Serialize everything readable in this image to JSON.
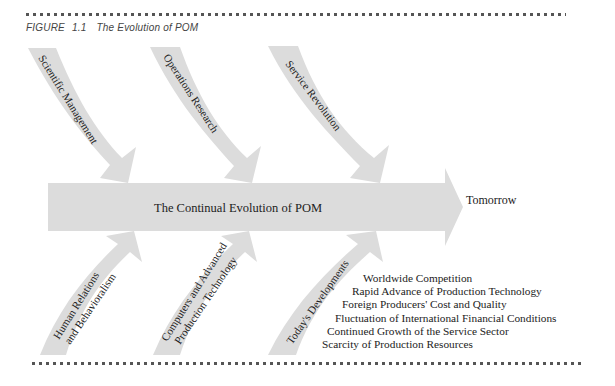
{
  "figure": {
    "caption_prefix": "FIGURE",
    "caption_number": "1.1",
    "caption_title": "The Evolution of POM"
  },
  "main_arrow": {
    "label": "The Continual Evolution of POM",
    "destination": "Tomorrow"
  },
  "top_arrows": [
    {
      "label": "Scientific Management"
    },
    {
      "label": "Operations Research"
    },
    {
      "label": "Service Revolution"
    }
  ],
  "bottom_arrows": [
    {
      "line1": "Human Relations",
      "line2": "and Behavioralism"
    },
    {
      "line1": "Computers and Advanced",
      "line2": "Production Technology"
    },
    {
      "line1": "Today's Developments",
      "line2": ""
    }
  ],
  "todays_developments": [
    "Worldwide Competition",
    "Rapid Advance of Production Technology",
    "Foreign Producers' Cost and Quality",
    "Fluctuation of International Financial Conditions",
    "Continued Growth of the Service Sector",
    "Scarcity of Production Resources"
  ],
  "colors": {
    "arrow_fill": "#dcdcdc",
    "dot_rule": "#555555",
    "text": "#222222"
  }
}
